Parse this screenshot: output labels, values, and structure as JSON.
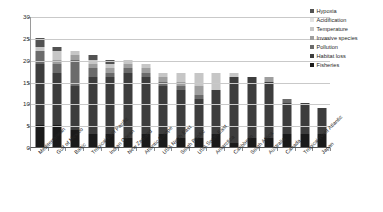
{
  "chart_data": {
    "type": "bar",
    "subtype": "stacked-bar-vertical",
    "title": "",
    "subtitle": "",
    "xlabel": "",
    "ylabel": "",
    "ylim": [
      0,
      30
    ],
    "ytick_step": 5,
    "ytick_labels": [
      "0",
      "5",
      "10",
      "15",
      "20",
      "25",
      "30"
    ],
    "ytick_values": [
      0,
      5,
      10,
      15,
      20,
      25,
      30
    ],
    "grid": true,
    "grid_axis": "y",
    "legend_position": "right",
    "categories": [
      "Mediterranean",
      "Gulf of Mexico",
      "Baltic",
      "Tropical East Pacific",
      "Indian Ocean",
      "New Zealand",
      "Atlantic Europe",
      "USA North East",
      "South Pacific",
      "USA South East",
      "Antarctica",
      "Caribbean",
      "South Africa",
      "Australia",
      "Canada",
      "Tropical West Atlantic",
      "Japan"
    ],
    "series": [
      {
        "name": "Fisheries",
        "color": "#1a1a1a",
        "values": [
          5,
          5,
          4,
          3,
          3,
          2,
          3,
          3,
          2,
          2,
          3,
          1,
          2,
          2,
          3,
          3,
          3
        ]
      },
      {
        "name": "Habitat loss",
        "color": "#3d3d3d",
        "values": [
          14,
          12,
          10,
          13,
          13,
          15,
          13,
          11,
          11,
          9,
          10,
          15,
          14,
          13,
          7,
          7,
          6
        ]
      },
      {
        "name": "Pollution",
        "color": "#6b6b6b",
        "values": [
          3,
          2,
          6,
          2,
          1,
          1,
          1,
          1,
          1,
          1,
          0,
          0,
          0,
          0,
          1,
          0,
          0
        ]
      },
      {
        "name": "Invasive species",
        "color": "#9e9e9e",
        "values": [
          0,
          1,
          1,
          1,
          1,
          1,
          1,
          1,
          1,
          2,
          0,
          0,
          0,
          1,
          0,
          0,
          0
        ]
      },
      {
        "name": "Temperature",
        "color": "#c6c6c6",
        "values": [
          1,
          2,
          1,
          1,
          1,
          1,
          1,
          1,
          2,
          3,
          4,
          1,
          0,
          0,
          0,
          0,
          0
        ]
      },
      {
        "name": "Acidification",
        "color": "#e3e3e3",
        "values": [
          0,
          0,
          0,
          0,
          0,
          0,
          0,
          0,
          0,
          0,
          0,
          0,
          0,
          0,
          0,
          0,
          0
        ]
      },
      {
        "name": "Hypoxia",
        "color": "#525252",
        "values": [
          2,
          1,
          0,
          1,
          1,
          0,
          0,
          0,
          0,
          0,
          0,
          0,
          0,
          0,
          0,
          0,
          0
        ]
      }
    ],
    "totals": [
      25,
      23,
      22,
      21,
      20,
      20,
      19,
      17,
      17,
      17,
      17,
      17,
      16,
      16,
      11,
      10,
      9
    ],
    "legend": [
      {
        "label": "Hypoxia",
        "color": "#525252"
      },
      {
        "label": "Acidification",
        "color": "#e3e3e3"
      },
      {
        "label": "Temperature",
        "color": "#c6c6c6"
      },
      {
        "label": "Invasive species",
        "color": "#9e9e9e"
      },
      {
        "label": "Pollution",
        "color": "#6b6b6b"
      },
      {
        "label": "Habitat loss",
        "color": "#3d3d3d"
      },
      {
        "label": "Fisheries",
        "color": "#1a1a1a"
      }
    ]
  }
}
